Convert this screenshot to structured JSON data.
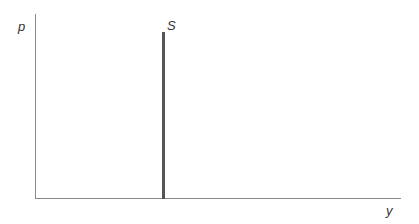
{
  "chart_data": {
    "type": "line",
    "title": "",
    "xlabel": "y",
    "ylabel": "p",
    "grid": false,
    "legend": null,
    "series": [
      {
        "name": "S",
        "description": "vertical supply curve (perfectly inelastic)",
        "color": "#555555"
      }
    ],
    "annotations": [
      {
        "text": "S",
        "position": "top of vertical line"
      }
    ]
  },
  "labels": {
    "y_axis": "p",
    "x_axis": "y",
    "curve": "S"
  }
}
